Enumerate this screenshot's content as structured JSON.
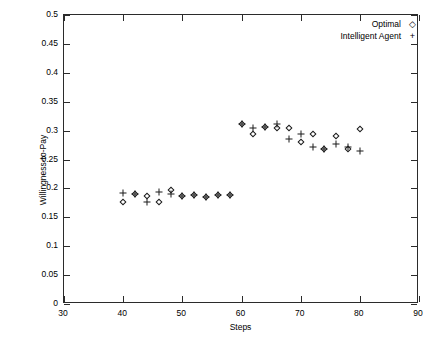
{
  "chart_data": {
    "type": "scatter",
    "title": "",
    "xlabel": "Steps",
    "ylabel": "Willingness-to-Pay",
    "xlim": [
      30,
      90
    ],
    "ylim": [
      0,
      0.5
    ],
    "xticks": [
      30,
      40,
      50,
      60,
      70,
      80,
      90
    ],
    "yticks": [
      0,
      0.05,
      0.1,
      0.15,
      0.2,
      0.25,
      0.3,
      0.35,
      0.4,
      0.45,
      0.5
    ],
    "xtick_labels": [
      "30",
      "40",
      "50",
      "60",
      "70",
      "80",
      "90"
    ],
    "ytick_labels": [
      "0",
      "0.05",
      "0.1",
      "0.15",
      "0.2",
      "0.25",
      "0.3",
      "0.35",
      "0.4",
      "0.45",
      "0.5"
    ],
    "grid": false,
    "legend_position": "top-right",
    "x": [
      40,
      42,
      44,
      46,
      48,
      50,
      52,
      54,
      56,
      58,
      60,
      62,
      64,
      66,
      68,
      70,
      72,
      74,
      76,
      78,
      80
    ],
    "series": [
      {
        "name": "Optimal",
        "marker": "diamond",
        "values": [
          0.177,
          0.19,
          0.186,
          0.177,
          0.198,
          0.186,
          0.188,
          0.185,
          0.188,
          0.188,
          0.311,
          0.294,
          0.306,
          0.305,
          0.304,
          0.28,
          0.294,
          0.268,
          0.291,
          0.269,
          0.302
        ]
      },
      {
        "name": "Intelligent Agent",
        "marker": "plus",
        "values": [
          0.192,
          0.19,
          0.176,
          0.194,
          0.19,
          0.186,
          0.188,
          0.185,
          0.189,
          0.188,
          0.312,
          0.304,
          0.306,
          0.312,
          0.286,
          0.294,
          0.271,
          0.268,
          0.276,
          0.272,
          0.264
        ]
      }
    ]
  },
  "legend": {
    "items": [
      {
        "label": "Optimal",
        "marker": "◇"
      },
      {
        "label": "Intelligent Agent",
        "marker": "+"
      }
    ]
  }
}
